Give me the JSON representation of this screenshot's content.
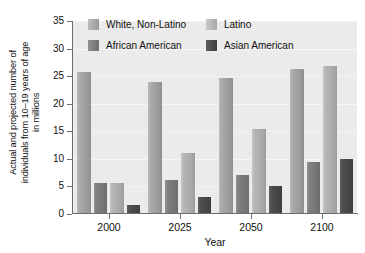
{
  "chart_data": {
    "type": "bar",
    "title": "",
    "xlabel": "Year",
    "ylabel": "Actual and projected number of individuals from 10–19 years of age in millions",
    "ylabel_lines": [
      "Actual and projected number of",
      "individuals from 10–19 years of age",
      "in millions"
    ],
    "categories": [
      "2000",
      "2025",
      "2050",
      "2100"
    ],
    "series": [
      {
        "name": "White, Non-Latino",
        "color": "#a5a5a5",
        "values": [
          25.8,
          24.0,
          24.7,
          26.3
        ]
      },
      {
        "name": "African American",
        "color": "#787878",
        "values": [
          5.7,
          6.2,
          7.1,
          9.4
        ]
      },
      {
        "name": "Latino",
        "color": "#b2b2b2",
        "values": [
          5.6,
          11.0,
          15.5,
          26.8
        ]
      },
      {
        "name": "Asian American",
        "color": "#454545",
        "values": [
          1.6,
          3.0,
          5.1,
          10.0
        ]
      }
    ],
    "ylim": [
      0,
      35
    ],
    "yticks": [
      0,
      5,
      10,
      15,
      20,
      25,
      30,
      35
    ],
    "ytick_labels": [
      "0",
      "5",
      "10",
      "15",
      "20",
      "25",
      "30",
      "35"
    ],
    "grid": true,
    "grid_axis": "y",
    "legend_position": "upper-center",
    "legend_entries": [
      "White, Non-Latino",
      "Latino",
      "African American",
      "Asian American"
    ],
    "plot_background": "#ebebeb",
    "axis_color": "#6d6d6d"
  }
}
